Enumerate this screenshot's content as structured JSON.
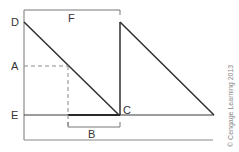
{
  "diagram": {
    "labels": {
      "D": "D",
      "A": "A",
      "E": "E",
      "F": "F",
      "B": "B",
      "C": "C"
    },
    "copyright": "© Cengage Learning 2013",
    "colors": {
      "line": "#3a3a3a",
      "dashed": "#8a8a8a",
      "bracket": "#777777",
      "text": "#333333"
    }
  }
}
